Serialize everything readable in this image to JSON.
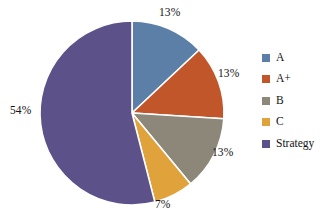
{
  "background_color": "#FFFFFF",
  "chart_data": {
    "type": "pie",
    "title": "",
    "subtitle": "",
    "xlabel": "",
    "ylabel": "",
    "start_angle_deg": 0,
    "direction": "clockwise",
    "grid": false,
    "legend_position": "right",
    "slice_border_color": "#FFFFFF",
    "label_text_color": "#121212",
    "categories": [
      "A",
      "A+",
      "B",
      "C",
      "Strategy"
    ],
    "values": [
      13,
      13,
      13,
      7,
      54
    ],
    "value_labels": [
      "13%",
      "13%",
      "13%",
      "7%",
      "54%"
    ],
    "colors": [
      "#5B7FA6",
      "#C0562A",
      "#8D8779",
      "#E0A23A",
      "#5C5189"
    ],
    "slices": [
      {
        "name": "A",
        "value": 13,
        "label": "13%",
        "color": "#5B7FA6",
        "label_left": 159,
        "label_top": 7
      },
      {
        "name": "A+",
        "value": 13,
        "label": "13%",
        "color": "#C0562A",
        "label_left": 218,
        "label_top": 68
      },
      {
        "name": "B",
        "value": 13,
        "label": "13%",
        "color": "#8D8779",
        "label_left": 212,
        "label_top": 147
      },
      {
        "name": "C",
        "value": 7,
        "label": "7%",
        "color": "#E0A23A",
        "label_left": 155,
        "label_top": 199
      },
      {
        "name": "Strategy",
        "value": 54,
        "label": "54%",
        "color": "#5C5189",
        "label_left": 10,
        "label_top": 105
      }
    ],
    "geometry": {
      "center_x": 132,
      "center_y": 113,
      "radius": 92
    }
  },
  "legend": {
    "items": [
      {
        "label": "A",
        "color": "#5B7FA6"
      },
      {
        "label": "A+",
        "color": "#C0562A"
      },
      {
        "label": "B",
        "color": "#8D8779"
      },
      {
        "label": "C",
        "color": "#E0A23A"
      },
      {
        "label": "Strategy",
        "color": "#5C5189"
      }
    ]
  }
}
